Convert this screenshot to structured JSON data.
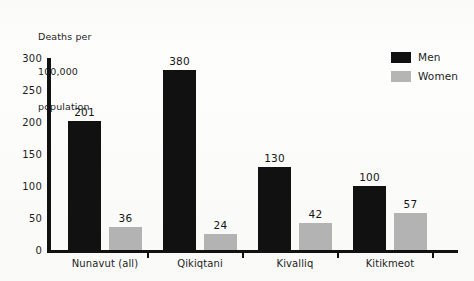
{
  "chart_data": {
    "type": "bar",
    "title": "",
    "subtitle": "",
    "ylabel": "Deaths per 100,000 population",
    "ylabel_lines": [
      "Deaths per",
      "100,000",
      "population"
    ],
    "xlabel": "",
    "ylim": [
      0,
      300
    ],
    "yticks": [
      0,
      50,
      100,
      150,
      200,
      250,
      300
    ],
    "ytick_labels": [
      "0",
      "50",
      "100",
      "150",
      "200",
      "250",
      "300"
    ],
    "grid": false,
    "legend_position": "top-right",
    "categories": [
      "Nunavut (all)",
      "Qikiqtani",
      "Kivalliq",
      "Kitikmeot"
    ],
    "series": [
      {
        "name": "Men",
        "color": "#111111",
        "values": [
          201,
          380,
          130,
          100
        ]
      },
      {
        "name": "Women",
        "color": "#b5b5b5",
        "values": [
          36,
          24,
          42,
          57
        ]
      }
    ],
    "data_labels": [
      "201",
      "36",
      "380",
      "24",
      "130",
      "42",
      "100",
      "57"
    ]
  },
  "legend": {
    "items": [
      {
        "label": "Men",
        "color": "#111111"
      },
      {
        "label": "Women",
        "color": "#b5b5b5"
      }
    ]
  },
  "colors": {
    "men": "#111111",
    "women": "#b5b5b5",
    "axis": "#111111",
    "text": "#1d1d1d",
    "background": "#fdfdfc"
  }
}
